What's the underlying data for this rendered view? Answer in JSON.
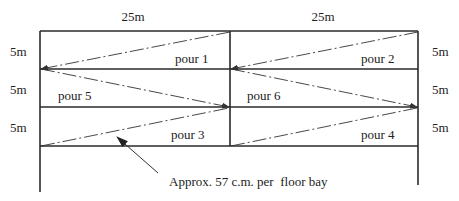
{
  "diagram": {
    "dimensions": {
      "top": [
        "25m",
        "25m"
      ],
      "left": [
        "5m",
        "5m",
        "5m"
      ],
      "right": [
        "5m",
        "5m",
        "5m"
      ]
    },
    "pours": [
      {
        "label": "pour 1",
        "bay": "row1-left"
      },
      {
        "label": "pour 2",
        "bay": "row1-right"
      },
      {
        "label": "pour 5",
        "bay": "row2-left"
      },
      {
        "label": "pour 6",
        "bay": "row2-right"
      },
      {
        "label": "pour 3",
        "bay": "row3-left"
      },
      {
        "label": "pour 4",
        "bay": "row3-right"
      }
    ],
    "annotation": "Approx. 57 c.m. per  floor bay",
    "colors": {
      "line": "#2a2a2a",
      "text": "#222222",
      "background": "#ffffff"
    }
  }
}
